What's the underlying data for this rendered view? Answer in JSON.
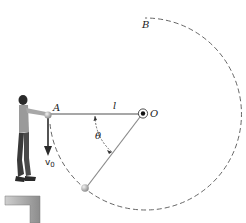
{
  "diagram": {
    "labels": {
      "point_a": "A",
      "point_b": "B",
      "point_o": "O",
      "length": "l",
      "angle": "θ",
      "velocity": "v",
      "velocity_sub": "0"
    },
    "colors": {
      "rope": "#8a8a8a",
      "dashed_path": "#555555",
      "ball": "#b0b0b0",
      "ledge": "#9a9a9a",
      "text": "#222222"
    }
  }
}
